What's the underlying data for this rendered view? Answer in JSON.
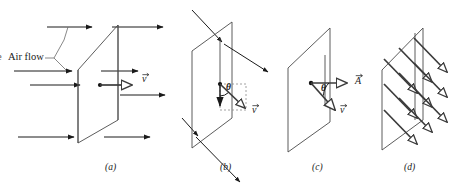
{
  "figure": {
    "type": "physics-diagram",
    "background_color": "#ffffff",
    "ink_color": "#1a1a1a",
    "plane_color": "#4a4a4a",
    "arrow_color": "#3b3b3b"
  },
  "annotations": {
    "air_flow_label": "Air flow",
    "truncated_left_glyph": "e"
  },
  "panels": [
    {
      "id": "a",
      "caption": "(a)",
      "caption_x": 105,
      "caption_y": 168,
      "content": "Air flowing horizontally through a tilted rectangular loop; solid arrows show streamlines, open arrow shows velocity v",
      "labels": [
        {
          "name": "velocity-vector-label",
          "text": "v",
          "accent": "arrow",
          "x": 142,
          "y": 79
        }
      ],
      "solid_arrow_rows": [
        {
          "y": 27,
          "x1": 47,
          "x2": 93,
          "head_x": 80
        },
        {
          "y": 27,
          "x1": 110,
          "x2": 163,
          "head_x": 157
        },
        {
          "y": 71,
          "x1": 14,
          "x2": 75,
          "head_x": 58
        },
        {
          "y": 71,
          "x1": 105,
          "x2": 138,
          "head_x": 132
        },
        {
          "y": 85,
          "x1": 30,
          "x2": 80,
          "head_x": 73
        },
        {
          "y": 95,
          "x1": 120,
          "x2": 165,
          "head_x": 160
        },
        {
          "y": 137,
          "x1": 18,
          "x2": 78,
          "head_x": 60
        },
        {
          "y": 137,
          "x1": 105,
          "x2": 150,
          "head_x": 133
        }
      ]
    },
    {
      "id": "b",
      "caption": "(b)",
      "caption_x": 220,
      "caption_y": 168,
      "content": "Tilted plane with oblique air flow arrows; angle theta between the normal-direction component and the velocity v",
      "labels": [
        {
          "name": "angle-label",
          "text": "θ",
          "x": 228,
          "y": 88
        },
        {
          "name": "velocity-vector-label",
          "text": "v",
          "accent": "arrow",
          "x": 253,
          "y": 110
        }
      ]
    },
    {
      "id": "c",
      "caption": "(c)",
      "caption_x": 312,
      "caption_y": 168,
      "content": "Plane with area vector A normal to the surface and velocity vector v at angle theta to it",
      "labels": [
        {
          "name": "angle-label",
          "text": "θ",
          "x": 324,
          "y": 89
        },
        {
          "name": "area-vector-label",
          "text": "A",
          "accent": "arrow",
          "x": 356,
          "y": 81
        },
        {
          "name": "velocity-vector-label",
          "text": "v",
          "accent": "arrow",
          "x": 341,
          "y": 110
        }
      ]
    },
    {
      "id": "d",
      "caption": "(d)",
      "caption_x": 404,
      "caption_y": 168,
      "content": "Plane penetrated by a regular array of parallel oblique velocity arrows representing the flow field"
    }
  ]
}
